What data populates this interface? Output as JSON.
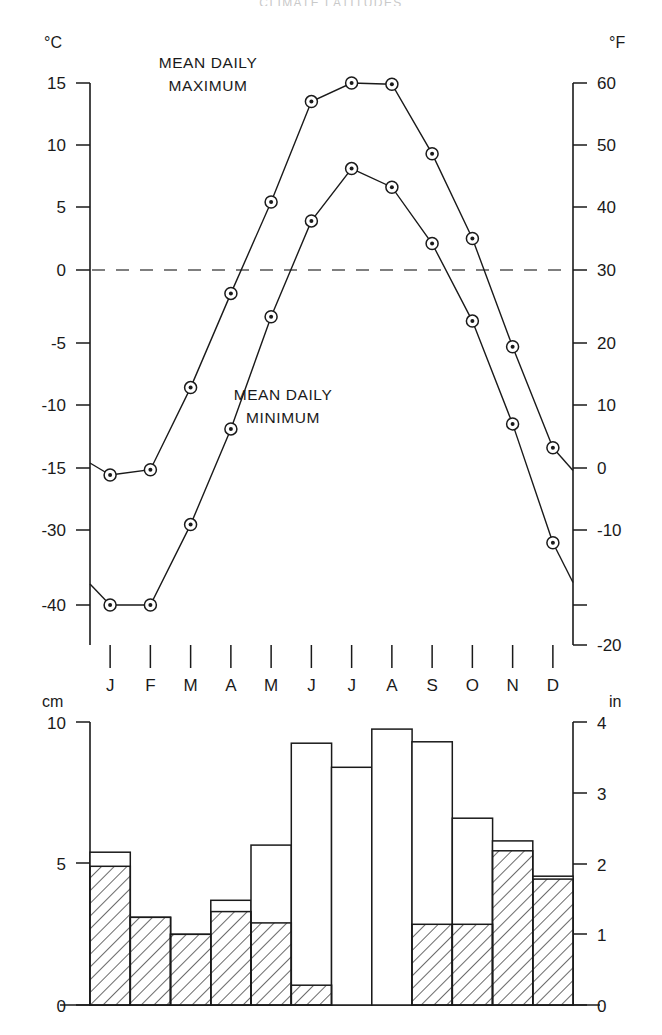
{
  "figure": {
    "title_partial": "CLIMATE  LATITUDES",
    "annotations": [
      {
        "id": "max",
        "text_line1": "MEAN DAILY",
        "text_line2": "MAXIMUM"
      },
      {
        "id": "min",
        "text_line1": "MEAN DAILY",
        "text_line2": "MINIMUM"
      }
    ]
  },
  "chart_data": [
    {
      "type": "line",
      "id": "temperature",
      "title": "",
      "xlabel": "",
      "ylabel": "°C",
      "y2label": "°F",
      "categories": [
        "J",
        "F",
        "M",
        "A",
        "M",
        "J",
        "J",
        "A",
        "S",
        "O",
        "N",
        "D"
      ],
      "ytick_labels_left": [
        "15",
        "10",
        "5",
        "0",
        "-5",
        "-10",
        "-15",
        "-30",
        "-40"
      ],
      "ytick_values_left": [
        15,
        10,
        5,
        0,
        -5,
        -10,
        -15,
        -30,
        -40
      ],
      "ytick_labels_right": [
        "60",
        "50",
        "40",
        "30",
        "20",
        "10",
        "0",
        "-10",
        "-20"
      ],
      "ytick_values_right": [
        60,
        50,
        40,
        30,
        20,
        10,
        0,
        -10,
        -20
      ],
      "axis_note": "left axis is broken between -15 and -30",
      "zero_reference_line": 0,
      "grid": false,
      "legend": "inline-annotations",
      "series": [
        {
          "name": "MEAN DAILY MAXIMUM",
          "values": [
            -16.7,
            -15.4,
            -8.6,
            -1.6,
            5.4,
            13.5,
            17.2,
            14.9,
            9.3,
            2.5,
            -5.3,
            -13.4
          ]
        },
        {
          "name": "MEAN DAILY MINIMUM",
          "values": [
            -40.4,
            -40.4,
            -28.7,
            -11.9,
            -3.2,
            3.9,
            8.1,
            6.6,
            2.1,
            -3.5,
            -11.5,
            -31.7
          ]
        }
      ]
    },
    {
      "type": "bar",
      "id": "precipitation",
      "title": "",
      "xlabel": "",
      "ylabel": "cm",
      "y2label": "in",
      "categories": [
        "J",
        "F",
        "M",
        "A",
        "M",
        "J",
        "J",
        "A",
        "S",
        "O",
        "N",
        "D"
      ],
      "ytick_labels_left": [
        "10",
        "5",
        "0"
      ],
      "ytick_values_left": [
        10,
        5,
        0
      ],
      "ytick_labels_right": [
        "4",
        "3",
        "2",
        "1",
        "0"
      ],
      "ytick_values_right": [
        4,
        3,
        2,
        1,
        0
      ],
      "ylim": [
        0,
        10
      ],
      "grid": false,
      "series": [
        {
          "name": "Total precipitation (cm)",
          "values": [
            5.4,
            3.1,
            2.5,
            3.7,
            5.65,
            9.25,
            8.4,
            9.75,
            9.3,
            6.6,
            5.8,
            4.55
          ]
        },
        {
          "name": "Snowfall water equivalent (cm, hatched)",
          "values": [
            4.9,
            3.1,
            2.5,
            3.3,
            2.9,
            0.7,
            0.0,
            0.0,
            2.85,
            2.85,
            5.45,
            4.45
          ]
        }
      ]
    }
  ]
}
